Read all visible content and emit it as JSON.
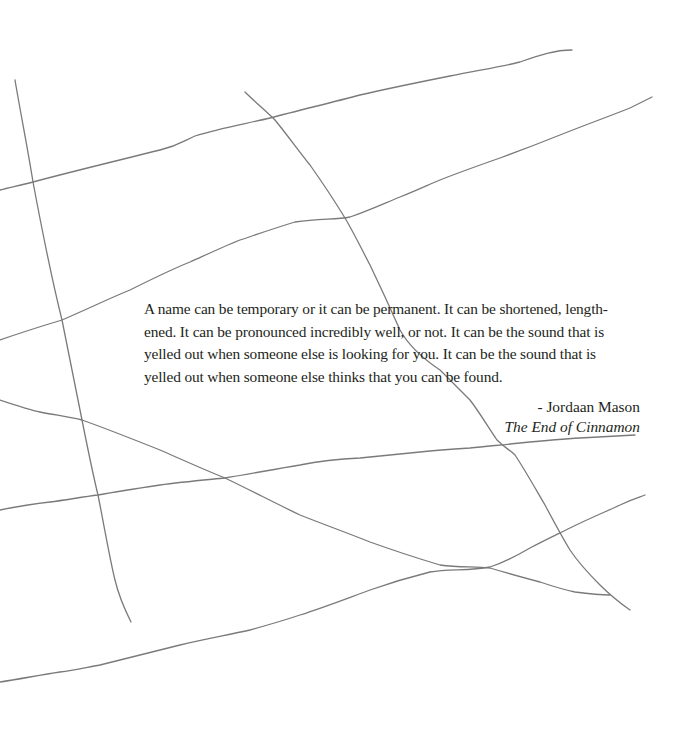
{
  "page": {
    "background_color": "#ffffff",
    "text_color": "#231f20",
    "line_color": "#7a7a7a"
  },
  "quote": {
    "lines": [
      "A name can be temporary or it can be permanent. It can be shortened, length-",
      "ened. It can be pronounced incredibly well, or not. It can be the sound that is",
      "yelled out when someone else is looking for you. It can be the sound that is",
      "yelled out when someone else thinks that you can be found."
    ]
  },
  "attribution": {
    "author": "- Jordaan Mason",
    "book_title": "The End of Cinnamon"
  },
  "decoration": {
    "hand_drawn_lines": [
      {
        "id": "line-a",
        "points": [
          [
            15,
            80
          ],
          [
            22,
            120
          ],
          [
            33,
            182
          ],
          [
            45,
            250
          ],
          [
            62,
            320
          ],
          [
            72,
            370
          ],
          [
            82,
            420
          ],
          [
            98,
            495
          ],
          [
            106,
            540
          ],
          [
            115,
            580
          ],
          [
            122,
            605
          ],
          [
            131,
            622
          ]
        ]
      },
      {
        "id": "line-b",
        "points": [
          [
            0,
            190
          ],
          [
            33,
            182
          ],
          [
            90,
            168
          ],
          [
            160,
            150
          ],
          [
            195,
            136
          ],
          [
            270,
            118
          ],
          [
            360,
            95
          ],
          [
            420,
            82
          ],
          [
            470,
            72
          ],
          [
            510,
            64
          ],
          [
            540,
            55
          ],
          [
            572,
            50
          ]
        ]
      },
      {
        "id": "line-c",
        "points": [
          [
            0,
            340
          ],
          [
            62,
            320
          ],
          [
            130,
            290
          ],
          [
            190,
            262
          ],
          [
            240,
            240
          ],
          [
            295,
            222
          ],
          [
            350,
            217
          ],
          [
            400,
            197
          ],
          [
            440,
            180
          ],
          [
            500,
            158
          ],
          [
            560,
            135
          ],
          [
            600,
            120
          ],
          [
            630,
            108
          ],
          [
            652,
            97
          ]
        ]
      },
      {
        "id": "line-d",
        "points": [
          [
            245,
            92
          ],
          [
            275,
            120
          ],
          [
            310,
            165
          ],
          [
            345,
            218
          ],
          [
            370,
            265
          ],
          [
            400,
            330
          ],
          [
            440,
            370
          ],
          [
            470,
            400
          ],
          [
            497,
            440
          ],
          [
            515,
            455
          ],
          [
            545,
            505
          ],
          [
            570,
            550
          ],
          [
            600,
            585
          ],
          [
            630,
            610
          ]
        ]
      },
      {
        "id": "line-e",
        "points": [
          [
            0,
            400
          ],
          [
            40,
            412
          ],
          [
            82,
            420
          ],
          [
            160,
            450
          ],
          [
            225,
            478
          ],
          [
            300,
            515
          ],
          [
            370,
            542
          ],
          [
            440,
            565
          ],
          [
            490,
            568
          ],
          [
            540,
            582
          ],
          [
            575,
            592
          ],
          [
            610,
            595
          ]
        ]
      },
      {
        "id": "line-f",
        "points": [
          [
            0,
            510
          ],
          [
            50,
            502
          ],
          [
            98,
            495
          ],
          [
            160,
            485
          ],
          [
            225,
            478
          ],
          [
            300,
            465
          ],
          [
            360,
            458
          ],
          [
            420,
            452
          ],
          [
            470,
            448
          ],
          [
            520,
            443
          ],
          [
            580,
            438
          ],
          [
            635,
            435
          ]
        ]
      },
      {
        "id": "line-g",
        "points": [
          [
            0,
            682
          ],
          [
            60,
            672
          ],
          [
            100,
            665
          ],
          [
            180,
            645
          ],
          [
            250,
            630
          ],
          [
            300,
            615
          ],
          [
            370,
            590
          ],
          [
            430,
            572
          ],
          [
            490,
            567
          ],
          [
            530,
            548
          ],
          [
            570,
            528
          ],
          [
            620,
            505
          ],
          [
            645,
            495
          ]
        ]
      }
    ]
  }
}
